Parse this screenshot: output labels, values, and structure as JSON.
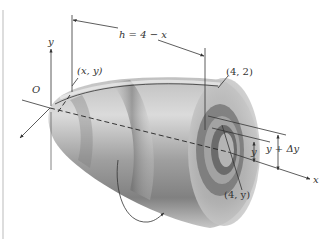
{
  "figure": {
    "type": "solid-of-revolution-shell-method",
    "labels": {
      "origin": "O",
      "y_axis": "y",
      "x_axis": "x",
      "point_xy": "(x, y)",
      "height": "h = 4 − x",
      "point_42": "(4, 2)",
      "point_4y": "(4, y)",
      "radius_y": "y",
      "radius_y_dy": "y + Δy"
    },
    "colors": {
      "outer_surface": "#8a8a8a",
      "inner_shell": "#5a5a5a",
      "highlight": "#d8d8d8",
      "line": "#333333"
    }
  }
}
